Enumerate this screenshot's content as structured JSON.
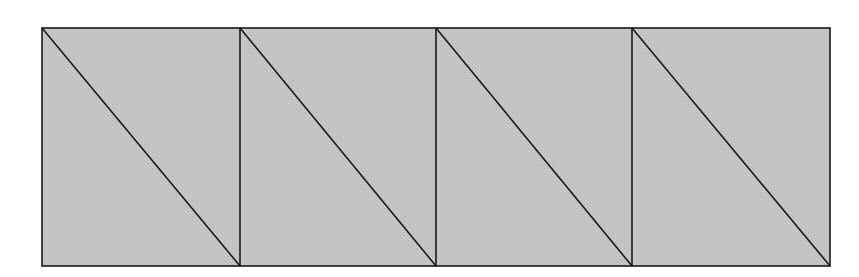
{
  "diagram": {
    "type": "triangulated-strip",
    "canvas": {
      "width": 859,
      "height": 277
    },
    "background_color": "#ffffff",
    "fill_color": "#c4c4c4",
    "stroke_color": "#1a1a1a",
    "stroke_width": 1.6,
    "outer_rect": {
      "x": 42,
      "y": 28,
      "width": 788,
      "height": 238
    },
    "cells": [
      {
        "index": 0,
        "x0": 42,
        "x1": 240,
        "diagonal": "top-left-to-bottom-right"
      },
      {
        "index": 1,
        "x0": 240,
        "x1": 436,
        "diagonal": "top-left-to-bottom-right"
      },
      {
        "index": 2,
        "x0": 436,
        "x1": 632,
        "diagonal": "top-left-to-bottom-right"
      },
      {
        "index": 3,
        "x0": 632,
        "x1": 830,
        "diagonal": "top-left-to-bottom-right"
      }
    ],
    "cell_count": 4,
    "triangle_count": 8
  }
}
